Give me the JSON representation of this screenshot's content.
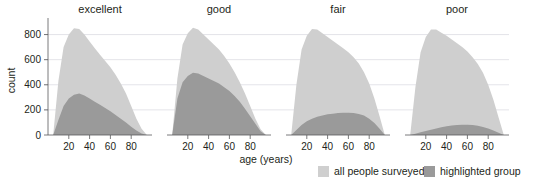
{
  "chart_data": {
    "type": "area",
    "title": "",
    "xlabel": "age (years)",
    "ylabel": "count",
    "xlim": [
      0,
      100
    ],
    "ylim": [
      0,
      900
    ],
    "grid": true,
    "grid_axis": "y",
    "legend_position": "bottom-right",
    "facet_variable": "general health",
    "facets": [
      "excellent",
      "good",
      "fair",
      "poor"
    ],
    "xticks": [
      20,
      40,
      60,
      80
    ],
    "xtick_labels": [
      "20",
      "40",
      "60",
      "80"
    ],
    "yticks": [
      0,
      200,
      400,
      600,
      800
    ],
    "ytick_labels": [
      "0",
      "200",
      "400",
      "600",
      "800"
    ],
    "series": [
      {
        "name": "all people surveyed",
        "color": "#cfcfcf",
        "legend_label": "all people surveyed"
      },
      {
        "name": "highlighted group",
        "color": "#9a9a9a",
        "legend_label": "highlighted group"
      }
    ],
    "x": [
      5,
      10,
      15,
      20,
      25,
      30,
      35,
      40,
      45,
      50,
      55,
      60,
      65,
      70,
      75,
      80,
      85,
      90,
      95
    ],
    "panels": [
      {
        "label": "excellent",
        "all_people_surveyed": [
          0,
          430,
          700,
          800,
          850,
          845,
          800,
          745,
          690,
          640,
          590,
          540,
          480,
          410,
          330,
          230,
          130,
          50,
          0
        ],
        "highlighted_group": [
          0,
          120,
          230,
          290,
          320,
          330,
          315,
          290,
          265,
          240,
          215,
          190,
          160,
          130,
          100,
          65,
          35,
          12,
          0
        ]
      },
      {
        "label": "good",
        "all_people_surveyed": [
          0,
          450,
          720,
          810,
          855,
          840,
          800,
          760,
          720,
          680,
          630,
          570,
          500,
          420,
          330,
          230,
          130,
          45,
          0
        ],
        "highlighted_group": [
          0,
          290,
          420,
          470,
          495,
          490,
          470,
          450,
          430,
          410,
          380,
          350,
          310,
          265,
          210,
          150,
          90,
          30,
          0
        ]
      },
      {
        "label": "fair",
        "all_people_surveyed": [
          0,
          400,
          680,
          790,
          845,
          840,
          810,
          780,
          750,
          720,
          690,
          660,
          620,
          570,
          500,
          410,
          290,
          150,
          0
        ],
        "highlighted_group": [
          0,
          40,
          80,
          110,
          130,
          145,
          155,
          165,
          170,
          175,
          178,
          178,
          175,
          168,
          155,
          130,
          95,
          50,
          0
        ]
      },
      {
        "label": "poor",
        "all_people_surveyed": [
          0,
          380,
          660,
          780,
          840,
          840,
          815,
          790,
          760,
          730,
          700,
          665,
          620,
          565,
          495,
          400,
          280,
          140,
          0
        ],
        "highlighted_group": [
          0,
          10,
          22,
          32,
          42,
          52,
          62,
          70,
          76,
          80,
          82,
          82,
          79,
          73,
          64,
          52,
          36,
          18,
          0
        ]
      }
    ]
  },
  "legend": {
    "items": [
      {
        "label": "all people surveyed",
        "color": "#cfcfcf",
        "swatch_name": "legend-swatch-all-people-surveyed"
      },
      {
        "label": "highlighted group",
        "color": "#9a9a9a",
        "swatch_name": "legend-swatch-highlighted-group"
      }
    ]
  }
}
